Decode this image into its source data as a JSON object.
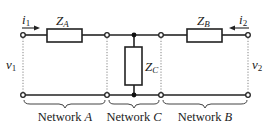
{
  "diagram": {
    "type": "two-port network cascade",
    "components": {
      "za": {
        "name": "Z",
        "sub": "A"
      },
      "zb": {
        "name": "Z",
        "sub": "B"
      },
      "zc": {
        "name": "Z",
        "sub": "C"
      }
    },
    "currents": {
      "i1": {
        "name": "i",
        "sub": "1",
        "direction": "right"
      },
      "i2": {
        "name": "i",
        "sub": "2",
        "direction": "left"
      }
    },
    "voltages": {
      "v1": {
        "name": "v",
        "sub": "1"
      },
      "v2": {
        "name": "v",
        "sub": "2"
      }
    },
    "networks": [
      {
        "label": "Network",
        "letter": "A"
      },
      {
        "label": "Network",
        "letter": "C"
      },
      {
        "label": "Network",
        "letter": "B"
      }
    ]
  },
  "colors": {
    "line": "#222222",
    "dotted": "#777777",
    "background": "#ffffff"
  }
}
